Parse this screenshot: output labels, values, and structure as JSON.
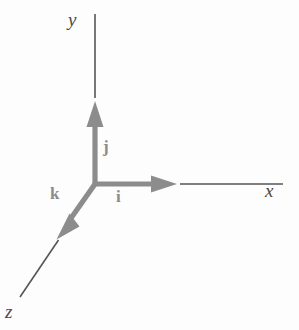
{
  "figure": {
    "title": "",
    "background_color": "#fdfdfd",
    "width": 299,
    "height": 330
  },
  "colors": {
    "axis_line": "#555555",
    "vector_arrow": "#8c8c8c",
    "axis_label_text": "#4a4a4a",
    "vector_label_text": "#8c8c8c"
  },
  "axes": {
    "y": {
      "label": "y",
      "label_style": "italic",
      "line_from": [
        95,
        14
      ],
      "line_to": [
        95,
        98
      ],
      "direction": "up"
    },
    "x": {
      "label": "x",
      "label_style": "italic",
      "line_from": [
        180,
        184
      ],
      "line_to": [
        283,
        184
      ],
      "direction": "right"
    },
    "z": {
      "label": "z",
      "label_style": "italic",
      "line_from": [
        58,
        240
      ],
      "line_to": [
        20,
        297
      ],
      "direction": "down-left"
    }
  },
  "origin": [
    95,
    184
  ],
  "vectors": [
    {
      "label": "i",
      "name": "unit-vector-i",
      "axis": "x",
      "from": [
        95,
        184
      ],
      "to": [
        175,
        184
      ],
      "color": "#8c8c8c"
    },
    {
      "label": "j",
      "name": "unit-vector-j",
      "axis": "y",
      "from": [
        95,
        184
      ],
      "to": [
        95,
        103
      ],
      "color": "#8c8c8c"
    },
    {
      "label": "k",
      "name": "unit-vector-k",
      "axis": "z",
      "from": [
        95,
        184
      ],
      "to": [
        58,
        238
      ],
      "color": "#8c8c8c"
    }
  ]
}
